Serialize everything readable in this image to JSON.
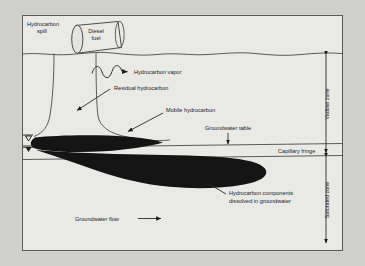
{
  "figure": {
    "type": "cross-section-diagram",
    "background_color": "#cfcfcb",
    "ink_color": "#1a1a1a",
    "plume_color": "#141414"
  },
  "labels": {
    "spill": "Hydrocarbon\nspill",
    "spill_line1": "Hydrocarbon",
    "spill_line2": "spill",
    "tank_line1": "Diesel",
    "tank_line2": "fuel",
    "vapor": "Hydrocarbon vapor",
    "residual": "Residual hydrocarbon",
    "mobile": "Mobile hydrocarbon",
    "groundwater_table": "Groundwater table",
    "capillary_fringe": "Capillary fringe",
    "dissolved_line1": "Hydrocarbon components",
    "dissolved_line2": "dissolved in groundwater",
    "groundwater_flow": "Groundwater flow",
    "vadose_zone": "Vadose zone",
    "saturated_zone": "Saturated zone"
  },
  "icons": {
    "water_table_hollow": "water-table-symbol-hollow",
    "water_table_filled": "water-table-symbol-filled",
    "vapor_squiggle": "wavy-vapor-arrow",
    "flow_arrow": "right-arrow",
    "vadose_extent": "double-headed-vertical-arrow",
    "saturated_extent": "double-headed-vertical-arrow"
  }
}
